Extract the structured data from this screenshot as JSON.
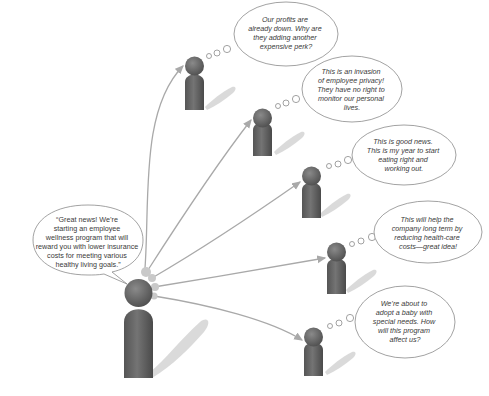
{
  "diagram": {
    "type": "communication-reactions",
    "speaker": {
      "role": "manager",
      "message": [
        "“Great news! We’re",
        "starting an employee",
        "wellness program that will",
        "reward you with lower insurance",
        "costs for meeting various",
        "healthy living goals.”"
      ]
    },
    "receivers": [
      {
        "id": "receiver-1",
        "thought": [
          "Our profits are",
          "already down. Why are",
          "they adding another",
          "expensive perk?"
        ]
      },
      {
        "id": "receiver-2",
        "thought": [
          "This is an invasion",
          "of employee privacy!",
          "They have no right to",
          "monitor our personal",
          "lives."
        ]
      },
      {
        "id": "receiver-3",
        "thought": [
          "This is good news.",
          "This is my year to start",
          "eating right and",
          "working out."
        ]
      },
      {
        "id": "receiver-4",
        "thought": [
          "This will help the",
          "company long term by",
          "reducing health-care",
          "costs—great idea!"
        ]
      },
      {
        "id": "receiver-5",
        "thought": [
          "We’re about to",
          "adopt a baby with",
          "special needs. How",
          "will this program",
          "affect us?"
        ]
      }
    ],
    "colors": {
      "figure": "#666666",
      "figure_dark": "#4a4a4a",
      "arrow": "#a9a9a9",
      "bubble_outline": "#8a8a8a",
      "text": "#3a3a3a"
    }
  }
}
